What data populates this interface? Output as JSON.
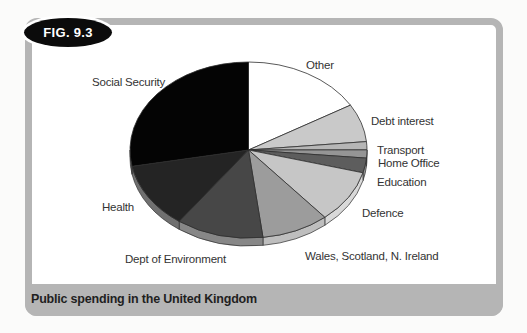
{
  "figure": {
    "badge": "FIG. 9.3",
    "caption": "Public spending in the United Kingdom"
  },
  "colors": {
    "frame": "#b5b5b5",
    "caption_bar": "#b5b5b5",
    "caption_text": "#1f1f1f",
    "badge_bg": "#0b0b0b",
    "badge_text": "#ffffff",
    "panel_bg": "#ffffff",
    "page_bg": "#fbfbfa",
    "slice_outline": "#2e2e2e",
    "label_text": "#333333"
  },
  "chart_data": {
    "type": "pie",
    "title": "Public spending in the United Kingdom",
    "style": "3d-ellipse",
    "start_angle_deg": 90,
    "direction": "clockwise",
    "values_shown": false,
    "legend_position": "labels-around-pie",
    "values_note": "percent shares estimated from slice angles; no numbers printed on chart",
    "slices": [
      {
        "label": "Other",
        "value": 16.5,
        "color": "#ffffff"
      },
      {
        "label": "Debt interest",
        "value": 7.0,
        "color": "#c9c9c9"
      },
      {
        "label": "Transport",
        "value": 1.5,
        "color": "#b6b6b6"
      },
      {
        "label": "Home Office",
        "value": 1.5,
        "color": "#959595"
      },
      {
        "label": "Education",
        "value": 2.7,
        "color": "#5d5d5d"
      },
      {
        "label": "Defence",
        "value": 9.7,
        "color": "#c6c6c6"
      },
      {
        "label": "Wales, Scotland, N. Ireland",
        "value": 9.2,
        "color": "#9c9c9c"
      },
      {
        "label": "Dept of Environment",
        "value": 11.9,
        "color": "#474747"
      },
      {
        "label": "Health",
        "value": 12.1,
        "color": "#242424"
      },
      {
        "label": "Social Security",
        "value": 28.0,
        "color": "#040404"
      }
    ]
  }
}
